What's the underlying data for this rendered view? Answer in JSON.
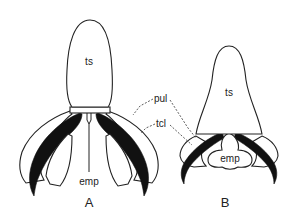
{
  "figure": {
    "panels": [
      {
        "id": "A",
        "label": "A",
        "parts": {
          "tarsal_segment": "ts",
          "empodium": "emp"
        }
      },
      {
        "id": "B",
        "label": "B",
        "parts": {
          "tarsal_segment": "ts",
          "empodium": "emp"
        }
      }
    ],
    "shared_labels": {
      "pulvillus": "pul",
      "tarsal_claw": "tcl"
    }
  }
}
